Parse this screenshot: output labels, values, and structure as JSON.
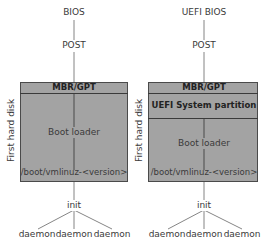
{
  "left": {
    "firmware": "BIOS",
    "post": "POST",
    "disk_label": "First hard disk",
    "partitions": [
      "MBR/GPT"
    ],
    "boot_loader": "Boot loader",
    "kernel": "/boot/vmlinuz-<version>",
    "init": "init",
    "daemons": [
      "daemon",
      "daemon",
      "daemon"
    ]
  },
  "right": {
    "firmware": "UEFI BIOS",
    "post": "POST",
    "disk_label": "First hard disk",
    "partitions": [
      "MBR/GPT",
      "UEFI System partition"
    ],
    "boot_loader": "Boot loader",
    "kernel": "/boot/vmlinuz-<version>",
    "init": "init",
    "daemons": [
      "daemon",
      "daemon",
      "daemon"
    ]
  },
  "colors": {
    "box_fill": "#a3a3a3",
    "box_border": "#4a4a4a",
    "line": "#555555"
  }
}
